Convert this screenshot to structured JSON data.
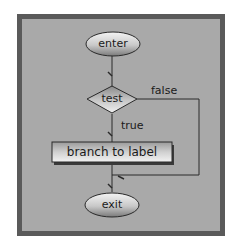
{
  "diagram": {
    "type": "flowchart",
    "nodes": {
      "enter": {
        "label": "enter",
        "shape": "ellipse"
      },
      "test": {
        "label": "test",
        "shape": "diamond"
      },
      "branch": {
        "label": "branch to label",
        "shape": "rectangle"
      },
      "exit": {
        "label": "exit",
        "shape": "ellipse"
      }
    },
    "edges": {
      "false_label": "false",
      "true_label": "true"
    },
    "colors": {
      "background": "#a9a9a9",
      "border": "#5a5a5a",
      "node_fill": "#d8d8d8",
      "line": "#2a2a2a"
    }
  }
}
